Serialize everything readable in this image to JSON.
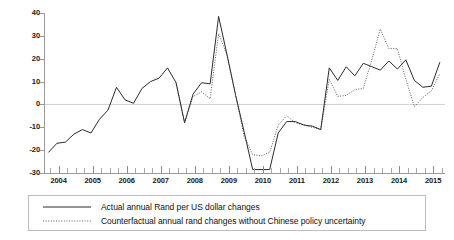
{
  "chart_data": {
    "type": "line",
    "title": "",
    "subtitle": "",
    "xlabel": "",
    "ylabel": "",
    "xlim": [
      2003.6,
      2015.35
    ],
    "ylim": [
      -30,
      40
    ],
    "grid": false,
    "zero_line": true,
    "legend_position": "bottom",
    "y_ticks": [
      40,
      30,
      20,
      10,
      0,
      -10,
      -20,
      -30
    ],
    "y_tick_labels": [
      "40",
      "30",
      "20",
      "10",
      "0",
      "-10",
      "-20",
      "-30"
    ],
    "x_ticks": [
      2004,
      2005,
      2006,
      2007,
      2008,
      2009,
      2010,
      2011,
      2012,
      2013,
      2014,
      2015
    ],
    "x_tick_labels": [
      "2004",
      "2005",
      "2006",
      "2007",
      "2008",
      "2009",
      "2010",
      "2011",
      "2012",
      "2013",
      "2014",
      "2015"
    ],
    "x_minor_ticks_per_interval": 4,
    "series": [
      {
        "name": "Actual annual Rand per US dollar changes",
        "style": "solid",
        "color": "#2b2b2b",
        "x": [
          2003.7,
          2003.95,
          2004.2,
          2004.45,
          2004.7,
          2004.95,
          2005.2,
          2005.45,
          2005.7,
          2005.95,
          2006.2,
          2006.45,
          2006.7,
          2006.95,
          2007.2,
          2007.45,
          2007.7,
          2007.95,
          2008.2,
          2008.45,
          2008.7,
          2008.95,
          2009.2,
          2009.45,
          2009.7,
          2009.95,
          2010.2,
          2010.45,
          2010.7,
          2010.95,
          2011.2,
          2011.45,
          2011.7,
          2011.95,
          2012.2,
          2012.45,
          2012.7,
          2012.95,
          2013.2,
          2013.45,
          2013.7,
          2013.95,
          2014.2,
          2014.45,
          2014.7,
          2014.95,
          2015.2
        ],
        "values": [
          -21.0,
          -17.0,
          -16.5,
          -13.0,
          -11.0,
          -12.5,
          -6.5,
          -2.5,
          7.5,
          2.0,
          0.5,
          7.0,
          10.0,
          11.5,
          16.0,
          9.5,
          -8.0,
          4.5,
          9.5,
          9.0,
          38.5,
          21.5,
          4.0,
          -12.0,
          -28.5,
          -28.5,
          -28.5,
          -12.5,
          -7.5,
          -7.5,
          -9.0,
          -9.5,
          -11.0,
          16.0,
          10.5,
          16.5,
          12.5,
          18.0,
          16.5,
          15.0,
          19.0,
          15.5,
          19.5,
          10.5,
          7.5,
          8.0,
          18.5
        ]
      },
      {
        "name": "Counterfactual annual rand changes without Chinese policy uncertainty",
        "style": "dotted",
        "color": "#5a5a5a",
        "x": [
          2007.45,
          2007.7,
          2007.95,
          2008.2,
          2008.45,
          2008.7,
          2008.95,
          2009.2,
          2009.45,
          2009.7,
          2009.95,
          2010.2,
          2010.45,
          2010.7,
          2010.95,
          2011.2,
          2011.45,
          2011.7,
          2011.95,
          2012.2,
          2012.45,
          2012.7,
          2012.95,
          2013.2,
          2013.45,
          2013.7,
          2013.95,
          2014.2,
          2014.45,
          2014.7,
          2014.95,
          2015.2
        ],
        "values": [
          9.5,
          -8.0,
          3.5,
          5.5,
          2.5,
          31.0,
          21.5,
          4.0,
          -14.0,
          -22.0,
          -22.5,
          -21.0,
          -9.0,
          -5.0,
          -8.0,
          -9.0,
          -10.0,
          -11.0,
          11.0,
          3.5,
          4.0,
          6.5,
          7.0,
          19.5,
          33.0,
          24.5,
          24.5,
          11.0,
          -1.0,
          3.0,
          6.0,
          13.5
        ]
      }
    ]
  },
  "legend": {
    "items": [
      {
        "label": "Actual annual Rand per US dollar changes",
        "style": "solid"
      },
      {
        "label": "Counterfactual annual rand changes without Chinese policy uncertainty",
        "style": "dotted"
      }
    ]
  }
}
